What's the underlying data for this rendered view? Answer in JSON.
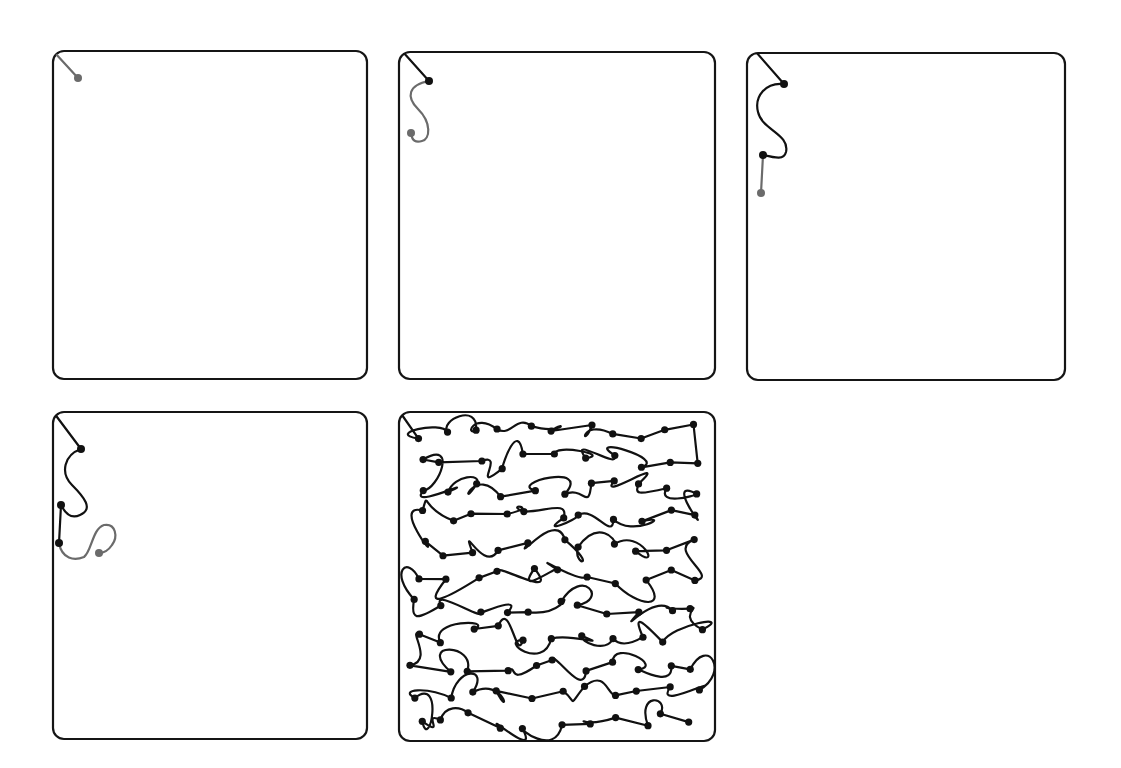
{
  "figure": {
    "colors": {
      "frame": "#151515",
      "completed_path": "#111111",
      "new_segment": "#6b6b6b",
      "background": "#ffffff"
    },
    "panels": [
      {
        "id": "step-1",
        "box": {
          "x": 52,
          "y": 50,
          "w": 316,
          "h": 330
        },
        "done_path": "",
        "new_path": "M 3 3 L 26 28",
        "done_nodes": [],
        "new_nodes": [
          [
            26,
            28
          ]
        ]
      },
      {
        "id": "step-2",
        "box": {
          "x": 398,
          "y": 51,
          "w": 318,
          "h": 329
        },
        "done_path": "M 5 1 L 31 30",
        "new_path": "M 31 30 C 10 34, 8 46, 20 58 C 34 72, 32 88, 24 90 C 18 92, 14 90, 13 82",
        "done_nodes": [
          [
            31,
            30
          ]
        ],
        "new_nodes": [
          [
            13,
            82
          ]
        ]
      },
      {
        "id": "step-3",
        "box": {
          "x": 746,
          "y": 52,
          "w": 320,
          "h": 329
        },
        "done_path": "M 10 0 L 38 32 C 20 30, 8 44, 12 60 C 16 78, 44 82, 40 100 C 38 108, 30 106, 17 103",
        "new_path": "M 17 103 L 15 141",
        "done_nodes": [
          [
            38,
            32
          ],
          [
            17,
            103
          ]
        ],
        "new_nodes": [
          [
            15,
            141
          ]
        ]
      },
      {
        "id": "step-4",
        "box": {
          "x": 52,
          "y": 411,
          "w": 316,
          "h": 329
        },
        "done_path": "M 2 2 L 29 38 C 12 44, 8 62, 20 74 C 32 86, 42 98, 28 104 C 20 108, 14 104, 9 94 L 7 132",
        "new_path": "M 7 132 C 10 148, 22 150, 32 146 C 40 140, 40 118, 52 114 C 64 112, 66 126, 60 134 C 56 140, 52 142, 47 142",
        "done_nodes": [
          [
            29,
            38
          ],
          [
            9,
            94
          ],
          [
            7,
            132
          ]
        ],
        "new_nodes": [
          [
            47,
            142
          ]
        ]
      },
      {
        "id": "step-final",
        "box": {
          "x": 398,
          "y": 411,
          "w": 318,
          "h": 331
        },
        "dense": true
      }
    ]
  }
}
